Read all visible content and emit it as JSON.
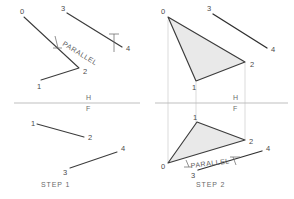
{
  "drawing": {
    "title_kind": "descriptive-geometry-construction",
    "background": "#ffffff",
    "ink_color": "#3b3b3b",
    "light_line_color": "#c9c9c9",
    "fill_color": "#e9e9e9",
    "label_color": "#4a4a4a"
  },
  "steps": [
    {
      "id": "step-1",
      "label": "STEP 1"
    },
    {
      "id": "step-2",
      "label": "STEP 2"
    }
  ],
  "reference_line": {
    "upper_label": "H",
    "lower_label": "F"
  },
  "annotations": {
    "parallel_top": "PARALLEL",
    "parallel_bottom": "PARALLEL"
  },
  "point_labels": {
    "zero": "0",
    "one": "1",
    "two": "2",
    "three": "3",
    "four": "4"
  },
  "step1": {
    "top_view": {
      "points": {
        "zero": [
          24,
          17
        ],
        "one": [
          41,
          80
        ],
        "two": [
          79,
          68
        ],
        "three": [
          67,
          13
        ],
        "four": [
          122,
          47
        ]
      },
      "labels": [
        {
          "name": "label-0",
          "text": "0",
          "x": 20,
          "y": 14
        },
        {
          "name": "label-1",
          "text": "1",
          "x": 37,
          "y": 88
        },
        {
          "name": "label-2",
          "text": "2",
          "x": 82,
          "y": 73
        },
        {
          "name": "label-3",
          "text": "3",
          "x": 62,
          "y": 11
        },
        {
          "name": "label-4",
          "text": "4",
          "x": 126,
          "y": 50
        }
      ]
    },
    "front_view": {
      "segment_12": {
        "from": [
          37,
          124
        ],
        "to": [
          84,
          137
        ]
      },
      "segment_34": {
        "from": [
          70,
          168
        ],
        "to": [
          117,
          152
        ]
      },
      "labels": [
        {
          "name": "label-1",
          "text": "1",
          "x": 31,
          "y": 125
        },
        {
          "name": "label-2",
          "text": "2",
          "x": 88,
          "y": 139
        },
        {
          "name": "label-3",
          "text": "3",
          "x": 64,
          "y": 174
        },
        {
          "name": "label-4",
          "text": "4",
          "x": 121,
          "y": 151
        }
      ]
    }
  },
  "step2": {
    "top_view": {
      "triangle": [
        [
          168,
          17
        ],
        [
          196,
          81
        ],
        [
          245,
          62
        ]
      ],
      "segment_34": {
        "from": [
          213,
          14
        ],
        "to": [
          267,
          48
        ]
      },
      "labels": [
        {
          "name": "label-0",
          "text": "0",
          "x": 162,
          "y": 14
        },
        {
          "name": "label-1",
          "text": "1",
          "x": 192,
          "y": 89
        },
        {
          "name": "label-2",
          "text": "2",
          "x": 249,
          "y": 66
        },
        {
          "name": "label-3",
          "text": "3",
          "x": 208,
          "y": 11
        },
        {
          "name": "label-4",
          "text": "4",
          "x": 271,
          "y": 51
        }
      ]
    },
    "front_view": {
      "triangle": [
        [
          168,
          163
        ],
        [
          197,
          122
        ],
        [
          245,
          140
        ]
      ],
      "segment_34": {
        "from": [
          198,
          170
        ],
        "to": [
          262,
          151
        ]
      },
      "labels": [
        {
          "name": "label-0",
          "text": "0",
          "x": 162,
          "y": 168
        },
        {
          "name": "label-1",
          "text": "1",
          "x": 193,
          "y": 120
        },
        {
          "name": "label-2",
          "text": "2",
          "x": 249,
          "y": 143
        },
        {
          "name": "label-3",
          "text": "3",
          "x": 193,
          "y": 177
        },
        {
          "name": "label-4",
          "text": "4",
          "x": 266,
          "y": 150
        }
      ]
    }
  }
}
